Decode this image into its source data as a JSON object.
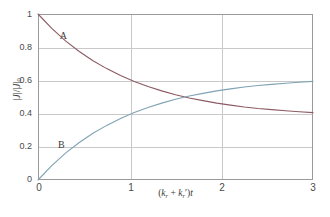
{
  "chart_data": {
    "type": "line",
    "title": "",
    "subtitle": "",
    "xlabel": "(k_r + k_r')t",
    "ylabel": "|J|/|J|_0",
    "xlim": [
      0,
      3
    ],
    "ylim": [
      0,
      1
    ],
    "grid": true,
    "legend_position": "inline-annotations",
    "xticks": [
      "0",
      "1",
      "2",
      "3"
    ],
    "xtick_values": [
      0,
      1,
      2,
      3
    ],
    "yticks": [
      "0",
      "0.2",
      "0.4",
      "0.6",
      "0.8",
      "1"
    ],
    "ytick_values": [
      0,
      0.2,
      0.4,
      0.6,
      0.8,
      1
    ],
    "annotations": [
      {
        "text": "A",
        "x": 0.27,
        "y": 0.87
      },
      {
        "text": "B",
        "x": 0.25,
        "y": 0.21
      }
    ],
    "series": [
      {
        "name": "A",
        "color": "#8c5a63",
        "label": "A",
        "x": [
          0,
          0.15,
          0.3,
          0.45,
          0.6,
          0.75,
          0.9,
          1.05,
          1.2,
          1.35,
          1.5,
          1.65,
          1.8,
          1.95,
          2.1,
          2.25,
          2.4,
          2.55,
          2.7,
          2.85,
          3
        ],
        "values": [
          1.0,
          0.913,
          0.838,
          0.774,
          0.718,
          0.671,
          0.629,
          0.594,
          0.563,
          0.537,
          0.514,
          0.494,
          0.478,
          0.463,
          0.451,
          0.44,
          0.431,
          0.424,
          0.417,
          0.411,
          0.406
        ]
      },
      {
        "name": "B",
        "color": "#7fa3b5",
        "label": "B",
        "x": [
          0,
          0.15,
          0.3,
          0.45,
          0.6,
          0.75,
          0.9,
          1.05,
          1.2,
          1.35,
          1.5,
          1.65,
          1.8,
          1.95,
          2.1,
          2.25,
          2.4,
          2.55,
          2.7,
          2.85,
          3
        ],
        "values": [
          0.0,
          0.087,
          0.162,
          0.226,
          0.282,
          0.329,
          0.371,
          0.406,
          0.437,
          0.463,
          0.486,
          0.506,
          0.522,
          0.537,
          0.549,
          0.56,
          0.569,
          0.576,
          0.583,
          0.589,
          0.594
        ]
      }
    ],
    "crossing_point": {
      "x": 1.42,
      "y": 0.5
    },
    "asymptotes": {
      "A": 0.375,
      "B": 0.625
    }
  }
}
